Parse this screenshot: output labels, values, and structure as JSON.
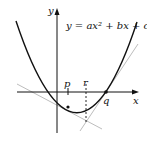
{
  "diagram": {
    "equation": "y = ax² + bx + c",
    "axis_labels": {
      "x": "x",
      "y": "y"
    },
    "point_labels": {
      "p": "p",
      "r": "r",
      "q": "q"
    },
    "colors": {
      "curve": "#111111",
      "axes": "#111111",
      "tangents": "#bbbbbb",
      "dashed": "#111111"
    }
  }
}
